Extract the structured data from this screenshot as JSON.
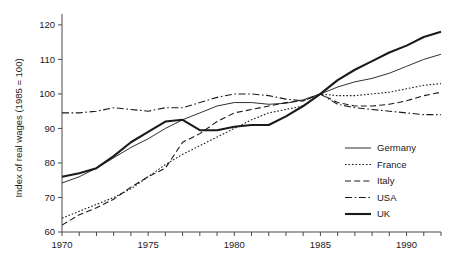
{
  "chart_data": {
    "type": "line",
    "title": "",
    "xlabel": "",
    "ylabel": "Index of real wages (1985 = 100)",
    "xlim": [
      1970,
      1992
    ],
    "ylim": [
      60,
      122
    ],
    "yticks": [
      60,
      70,
      80,
      90,
      100,
      110,
      120
    ],
    "xticks": [
      1970,
      1971,
      1972,
      1973,
      1974,
      1975,
      1976,
      1977,
      1978,
      1979,
      1980,
      1981,
      1982,
      1983,
      1984,
      1985,
      1986,
      1987,
      1988,
      1989,
      1990,
      1991,
      1992
    ],
    "xticklabels": [
      "1970",
      "",
      "",
      "",
      "",
      "1975",
      "",
      "",
      "",
      "",
      "1980",
      "",
      "",
      "",
      "",
      "1985",
      "",
      "",
      "",
      "",
      "1990",
      "",
      ""
    ],
    "grid": false,
    "legend_position": "right-middle",
    "x": [
      1970,
      1971,
      1972,
      1973,
      1974,
      1975,
      1976,
      1977,
      1978,
      1979,
      1980,
      1981,
      1982,
      1983,
      1984,
      1985,
      1986,
      1987,
      1988,
      1989,
      1990,
      1991,
      1992
    ],
    "series": [
      {
        "name": "Germany",
        "style": "solid-thin",
        "values": [
          74.2,
          76.0,
          78.5,
          81.5,
          84.5,
          87.0,
          90.0,
          92.5,
          94.5,
          96.5,
          97.5,
          97.5,
          97.0,
          97.3,
          98.3,
          100.0,
          102.0,
          103.5,
          104.5,
          106.0,
          108.0,
          110.0,
          111.5
        ]
      },
      {
        "name": "France",
        "style": "dotted",
        "values": [
          64.0,
          66.0,
          68.0,
          70.0,
          72.5,
          76.0,
          79.5,
          82.5,
          85.0,
          87.5,
          90.0,
          92.5,
          94.5,
          95.5,
          96.5,
          100.0,
          99.5,
          99.5,
          100.0,
          100.5,
          101.5,
          102.5,
          103.0
        ]
      },
      {
        "name": "Italy",
        "style": "dashed",
        "values": [
          62.0,
          65.0,
          67.0,
          69.5,
          73.0,
          76.0,
          78.5,
          86.0,
          88.5,
          92.0,
          94.5,
          95.5,
          96.5,
          97.5,
          98.0,
          100.0,
          97.5,
          96.5,
          96.5,
          97.0,
          98.0,
          99.5,
          100.5
        ]
      },
      {
        "name": "USA",
        "style": "dash-dot",
        "values": [
          94.5,
          94.5,
          95.0,
          96.0,
          95.5,
          95.0,
          96.0,
          96.0,
          97.5,
          99.0,
          100.0,
          100.0,
          99.5,
          98.5,
          98.0,
          100.0,
          97.0,
          96.0,
          95.5,
          95.0,
          94.5,
          94.0,
          94.0
        ]
      },
      {
        "name": "UK",
        "style": "solid-thick",
        "values": [
          76.0,
          77.0,
          78.5,
          82.0,
          86.0,
          89.0,
          92.0,
          92.5,
          89.5,
          89.5,
          90.5,
          91.0,
          91.0,
          93.5,
          96.5,
          100.0,
          104.0,
          107.0,
          109.5,
          112.0,
          114.0,
          116.5,
          118.0
        ]
      }
    ]
  },
  "legend": {
    "items": [
      {
        "label": "Germany"
      },
      {
        "label": "France"
      },
      {
        "label": "Italy"
      },
      {
        "label": "USA"
      },
      {
        "label": "UK"
      }
    ]
  },
  "axes": {
    "y_title": "Index of real wages (1985 = 100)",
    "y_tick_labels": [
      "60",
      "70",
      "80",
      "90",
      "100",
      "110",
      "120"
    ],
    "x_tick_labels": [
      "1970",
      "1975",
      "1980",
      "1985",
      "1990"
    ]
  }
}
